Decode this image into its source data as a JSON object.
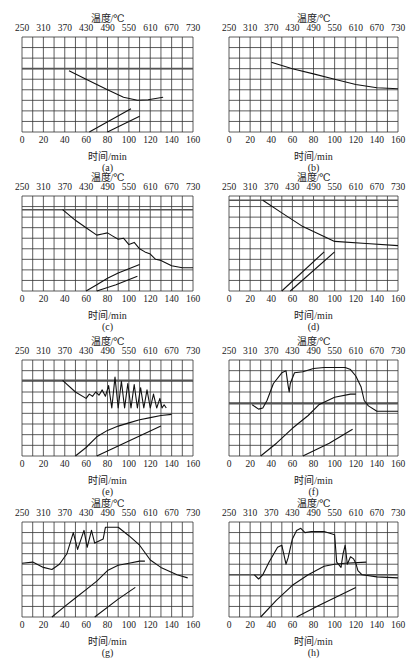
{
  "labels": {
    "temp_axis": "温度/℃",
    "time_axis": "时间/min",
    "temp_ticks": [
      "250",
      "310",
      "370",
      "430",
      "490",
      "550",
      "610",
      "670",
      "730"
    ],
    "time_ticks": [
      "0",
      "20",
      "40",
      "60",
      "80",
      "100",
      "120",
      "140",
      "160"
    ]
  },
  "chart_data": [
    {
      "id": "a",
      "caption": "(a)",
      "type": "line",
      "xlabel": "时间/min",
      "x2label": "温度/℃",
      "xlim": [
        0,
        160
      ],
      "x2lim": [
        250,
        730
      ],
      "hlines": [
        3
      ],
      "series": [
        {
          "name": "upper",
          "points": [
            [
              44,
              3.2
            ],
            [
              60,
              4.0
            ],
            [
              80,
              5.0
            ],
            [
              95,
              5.7
            ],
            [
              108,
              6.0
            ],
            [
              118,
              5.95
            ],
            [
              132,
              5.7
            ]
          ]
        },
        {
          "name": "lower-a",
          "points": [
            [
              63,
              9
            ],
            [
              102,
              6.8
            ]
          ]
        },
        {
          "name": "lower-b",
          "points": [
            [
              80,
              9
            ],
            [
              110,
              7.5
            ]
          ]
        }
      ]
    },
    {
      "id": "b",
      "caption": "(b)",
      "type": "line",
      "xlabel": "时间/min",
      "x2label": "温度/℃",
      "xlim": [
        0,
        160
      ],
      "x2lim": [
        250,
        730
      ],
      "hlines": [],
      "series": [
        {
          "name": "upper",
          "points": [
            [
              40,
              2.4
            ],
            [
              60,
              3.0
            ],
            [
              80,
              3.5
            ],
            [
              100,
              4.0
            ],
            [
              120,
              4.5
            ],
            [
              140,
              4.8
            ],
            [
              160,
              4.9
            ]
          ]
        }
      ]
    },
    {
      "id": "c",
      "caption": "(c)",
      "type": "line",
      "xlabel": "时间/min",
      "x2label": "温度/℃",
      "xlim": [
        0,
        160
      ],
      "x2lim": [
        250,
        730
      ],
      "hlines": [
        1.3
      ],
      "series": [
        {
          "name": "upper",
          "points": [
            [
              38,
              1.3
            ],
            [
              50,
              2.3
            ],
            [
              60,
              3.0
            ],
            [
              70,
              3.7
            ],
            [
              75,
              3.6
            ],
            [
              80,
              3.5
            ],
            [
              85,
              3.8
            ],
            [
              90,
              4.1
            ],
            [
              95,
              4.0
            ],
            [
              100,
              4.6
            ],
            [
              105,
              4.4
            ],
            [
              110,
              5.0
            ],
            [
              115,
              5.3
            ],
            [
              120,
              5.5
            ],
            [
              125,
              6.0
            ],
            [
              130,
              6.1
            ],
            [
              140,
              6.6
            ],
            [
              150,
              6.8
            ],
            [
              160,
              6.8
            ]
          ]
        },
        {
          "name": "lower-a",
          "points": [
            [
              60,
              9
            ],
            [
              70,
              8.4
            ],
            [
              80,
              7.8
            ],
            [
              90,
              7.3
            ],
            [
              100,
              6.9
            ],
            [
              110,
              6.5
            ]
          ]
        },
        {
          "name": "lower-b",
          "points": [
            [
              70,
              9
            ],
            [
              88,
              8.4
            ],
            [
              108,
              7.6
            ]
          ]
        }
      ]
    },
    {
      "id": "d",
      "caption": "(d)",
      "type": "line",
      "xlabel": "时间/min",
      "x2label": "温度/℃",
      "xlim": [
        0,
        160
      ],
      "x2lim": [
        250,
        730
      ],
      "hlines": [
        0.4
      ],
      "series": [
        {
          "name": "upper",
          "points": [
            [
              32,
              0.4
            ],
            [
              50,
              1.6
            ],
            [
              70,
              2.9
            ],
            [
              100,
              4.3
            ],
            [
              130,
              4.5
            ],
            [
              160,
              4.7
            ]
          ]
        },
        {
          "name": "lower-a",
          "points": [
            [
              50,
              9
            ],
            [
              90,
              5.3
            ]
          ]
        },
        {
          "name": "lower-b",
          "points": [
            [
              58,
              9
            ],
            [
              100,
              5.3
            ]
          ]
        }
      ]
    },
    {
      "id": "e",
      "caption": "(e)",
      "type": "line",
      "xlabel": "时间/min",
      "x2label": "温度/℃",
      "xlim": [
        0,
        160
      ],
      "x2lim": [
        250,
        730
      ],
      "hlines": [
        1.9
      ],
      "series": [
        {
          "name": "upper",
          "points": [
            [
              38,
              1.9
            ],
            [
              50,
              3.0
            ],
            [
              60,
              3.6
            ],
            [
              63,
              3.2
            ],
            [
              66,
              3.4
            ],
            [
              69,
              3.0
            ],
            [
              72,
              3.3
            ],
            [
              75,
              2.8
            ],
            [
              78,
              3.4
            ],
            [
              81,
              2.4
            ],
            [
              84,
              4.5
            ],
            [
              87,
              1.6
            ],
            [
              90,
              4.5
            ],
            [
              93,
              2.0
            ],
            [
              96,
              4.5
            ],
            [
              99,
              2.2
            ],
            [
              102,
              4.5
            ],
            [
              105,
              2.3
            ],
            [
              108,
              4.5
            ],
            [
              111,
              2.6
            ],
            [
              114,
              4.5
            ],
            [
              117,
              2.8
            ],
            [
              120,
              4.5
            ],
            [
              123,
              3.2
            ],
            [
              126,
              4.5
            ],
            [
              129,
              3.6
            ],
            [
              131,
              4.5
            ],
            [
              133,
              4.2
            ],
            [
              135,
              4.5
            ]
          ]
        },
        {
          "name": "lower-a",
          "points": [
            [
              50,
              9
            ],
            [
              60,
              8.2
            ],
            [
              70,
              7.2
            ],
            [
              80,
              6.6
            ],
            [
              90,
              6.2
            ],
            [
              100,
              5.9
            ],
            [
              110,
              5.6
            ],
            [
              120,
              5.4
            ],
            [
              130,
              5.2
            ],
            [
              140,
              5.1
            ]
          ]
        },
        {
          "name": "lower-b",
          "points": [
            [
              70,
              9
            ],
            [
              130,
              6.2
            ]
          ]
        }
      ]
    },
    {
      "id": "f",
      "caption": "(f)",
      "type": "line",
      "xlabel": "时间/min",
      "x2label": "温度/℃",
      "xlim": [
        0,
        160
      ],
      "x2lim": [
        250,
        730
      ],
      "hlines": [
        4.1
      ],
      "series": [
        {
          "name": "upper",
          "points": [
            [
              22,
              4.2
            ],
            [
              28,
              4.6
            ],
            [
              32,
              4.5
            ],
            [
              36,
              3.8
            ],
            [
              42,
              2.2
            ],
            [
              50,
              1.2
            ],
            [
              54,
              1.0
            ],
            [
              56,
              2.4
            ],
            [
              57,
              3.0
            ],
            [
              58,
              2.2
            ],
            [
              62,
              1.2
            ],
            [
              70,
              1.1
            ],
            [
              80,
              0.8
            ],
            [
              90,
              0.7
            ],
            [
              110,
              0.7
            ],
            [
              115,
              0.9
            ],
            [
              120,
              1.5
            ],
            [
              125,
              2.5
            ],
            [
              128,
              3.8
            ],
            [
              132,
              4.3
            ],
            [
              140,
              4.8
            ],
            [
              150,
              4.8
            ],
            [
              160,
              4.8
            ]
          ]
        },
        {
          "name": "lower-a",
          "points": [
            [
              30,
              9
            ],
            [
              45,
              7.8
            ],
            [
              60,
              6.4
            ],
            [
              75,
              5.2
            ],
            [
              85,
              4.2
            ],
            [
              100,
              3.5
            ],
            [
              115,
              3.2
            ],
            [
              120,
              3.2
            ]
          ]
        },
        {
          "name": "lower-b",
          "points": [
            [
              70,
              9
            ],
            [
              95,
              7.8
            ],
            [
              117,
              6.5
            ]
          ]
        }
      ]
    },
    {
      "id": "g",
      "caption": "(g)",
      "type": "line",
      "xlabel": "时间/min",
      "x2label": "温度/℃",
      "xlim": [
        0,
        160
      ],
      "x2lim": [
        250,
        730
      ],
      "hlines": [],
      "series": [
        {
          "name": "upper",
          "points": [
            [
              0,
              3.9
            ],
            [
              10,
              3.8
            ],
            [
              20,
              4.3
            ],
            [
              28,
              4.5
            ],
            [
              35,
              4.0
            ],
            [
              42,
              3.0
            ],
            [
              48,
              1.0
            ],
            [
              52,
              2.6
            ],
            [
              58,
              0.8
            ],
            [
              61,
              2.4
            ],
            [
              65,
              0.8
            ],
            [
              68,
              2.0
            ],
            [
              72,
              1.8
            ],
            [
              76,
              1.6
            ],
            [
              78,
              0.5
            ],
            [
              90,
              0.5
            ],
            [
              100,
              1.3
            ],
            [
              110,
              2.2
            ],
            [
              120,
              3.6
            ],
            [
              130,
              4.3
            ],
            [
              145,
              5.0
            ],
            [
              155,
              5.3
            ]
          ]
        },
        {
          "name": "lower-a",
          "points": [
            [
              28,
              9
            ],
            [
              40,
              8.0
            ],
            [
              50,
              7.2
            ],
            [
              60,
              6.4
            ],
            [
              70,
              5.6
            ],
            [
              80,
              4.6
            ],
            [
              90,
              4.1
            ],
            [
              100,
              3.9
            ],
            [
              110,
              3.7
            ],
            [
              115,
              3.7
            ]
          ]
        },
        {
          "name": "lower-b",
          "points": [
            [
              68,
              9
            ],
            [
              90,
              7.3
            ],
            [
              106,
              6.2
            ]
          ]
        }
      ]
    },
    {
      "id": "h",
      "caption": "(h)",
      "type": "line",
      "xlabel": "时间/min",
      "x2label": "温度/℃",
      "xlim": [
        0,
        160
      ],
      "x2lim": [
        250,
        730
      ],
      "hlines": [
        5.0
      ],
      "series": [
        {
          "name": "upper",
          "points": [
            [
              24,
              5.0
            ],
            [
              28,
              5.4
            ],
            [
              32,
              5.0
            ],
            [
              38,
              3.8
            ],
            [
              46,
              2.4
            ],
            [
              50,
              2.2
            ],
            [
              54,
              4.0
            ],
            [
              56,
              3.4
            ],
            [
              60,
              1.6
            ],
            [
              64,
              0.8
            ],
            [
              68,
              0.6
            ],
            [
              72,
              1.0
            ],
            [
              78,
              0.9
            ],
            [
              90,
              0.9
            ],
            [
              100,
              1.2
            ],
            [
              102,
              3.8
            ],
            [
              106,
              4.3
            ],
            [
              108,
              3.0
            ],
            [
              110,
              2.2
            ],
            [
              112,
              4.0
            ],
            [
              115,
              3.3
            ],
            [
              118,
              3.5
            ],
            [
              120,
              3.9
            ],
            [
              122,
              4.6
            ],
            [
              126,
              5.0
            ],
            [
              140,
              5.2
            ],
            [
              160,
              5.3
            ]
          ]
        },
        {
          "name": "lower-a",
          "points": [
            [
              30,
              9
            ],
            [
              45,
              7.4
            ],
            [
              60,
              6.0
            ],
            [
              75,
              5.0
            ],
            [
              90,
              4.2
            ],
            [
              100,
              4.0
            ],
            [
              110,
              3.9
            ],
            [
              130,
              3.8
            ]
          ]
        },
        {
          "name": "lower-b",
          "points": [
            [
              64,
              9
            ],
            [
              85,
              7.9
            ],
            [
              120,
              6.2
            ]
          ]
        }
      ]
    }
  ]
}
